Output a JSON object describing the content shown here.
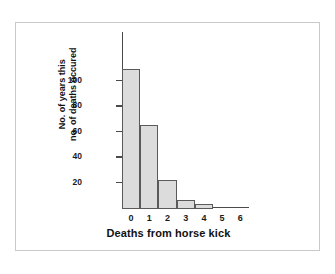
{
  "figure": {
    "background_color": "#ffffff",
    "frame_color": "#c9c9c9",
    "bar_fill_color": "#dcdcdc",
    "bar_edge_color": "#5a5a5a",
    "axis_color": "#4a4a4a"
  },
  "chart_data": {
    "type": "bar",
    "title": "",
    "xlabel": "Deaths from horse kick",
    "ylabel_line1": "No. of years this",
    "ylabel_line2": "no. of deaths occured",
    "categories": [
      "0",
      "1",
      "2",
      "3",
      "4",
      "5",
      "6"
    ],
    "values": [
      109,
      65,
      22,
      6,
      3,
      0,
      0
    ],
    "xtick_labels": [
      "0",
      "1",
      "2",
      "3",
      "4",
      "5",
      "6"
    ],
    "ytick_labels": [
      "20",
      "40",
      "60",
      "80",
      "100"
    ],
    "ytick_values": [
      20,
      40,
      60,
      80,
      100
    ],
    "ylim": [
      0,
      138
    ],
    "xlim": [
      -0.5,
      6.5
    ],
    "grid": false,
    "legend": false,
    "legend_position": "none"
  }
}
